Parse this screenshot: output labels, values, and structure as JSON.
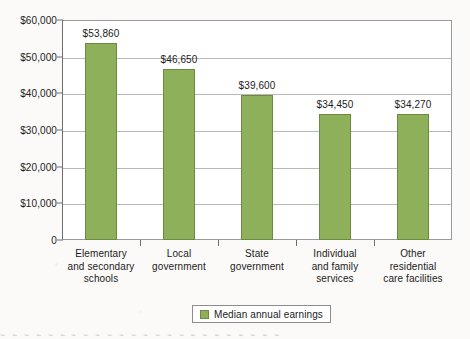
{
  "chart_data": {
    "type": "bar",
    "title": "",
    "xlabel": "",
    "ylabel": "",
    "categories": [
      "Elementary and secondary schools",
      "Local government",
      "State government",
      "Individual and family services",
      "Other residential care facilities"
    ],
    "category_lines": [
      [
        "Elementary",
        "and secondary",
        "schools"
      ],
      [
        "Local",
        "government"
      ],
      [
        "State",
        "government"
      ],
      [
        "Individual",
        "and family",
        "services"
      ],
      [
        "Other",
        "residential",
        "care facilities"
      ]
    ],
    "values": [
      53860,
      46650,
      39600,
      34450,
      34270
    ],
    "value_labels": [
      "$53,860",
      "$46,650",
      "$39,600",
      "$34,450",
      "$34,270"
    ],
    "ylim": [
      0,
      60000
    ],
    "ytick_values": [
      0,
      10000,
      20000,
      30000,
      40000,
      50000,
      60000
    ],
    "ytick_labels": [
      "0",
      "$10,000",
      "$20,000",
      "$30,000",
      "$40,000",
      "$50,000",
      "$60,000"
    ],
    "grid": true,
    "legend": {
      "position": "bottom-center",
      "entries": [
        {
          "label": "Median annual earnings",
          "color": "#8fb05a"
        }
      ]
    },
    "series_color": "#8fb05a",
    "series_border_color": "#6d8a3f"
  },
  "page": {
    "background": "#fbfaf8",
    "bleed_text": "⌁ ⌁ ⌁ ⌁ ⌁ ⌁ ⌁ ⌁ ⌁ ⌁ ⌁ ⌁ ⌁ ⌁ ⌁ ⌁ ⌁ ⌁ ⌁ ⌁ ⌁ ⌁ ⌁ ⌁"
  }
}
